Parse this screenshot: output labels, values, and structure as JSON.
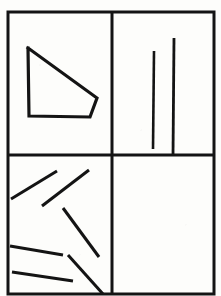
{
  "figure": {
    "background_color": "#fdfdfb",
    "ink_color": "#141414",
    "canvas": {
      "width": 221,
      "height": 296
    }
  },
  "frame": {
    "name": "outer-border",
    "x": 8,
    "y": 12,
    "width": 206,
    "height": 282,
    "stroke_width": 3
  },
  "dividers": [
    {
      "name": "vertical-divider",
      "orientation": "vertical",
      "x1": 112,
      "y1": 12,
      "x2": 112,
      "y2": 294,
      "stroke_width": 3
    },
    {
      "name": "horizontal-divider",
      "orientation": "horizontal",
      "x1": 8,
      "y1": 155,
      "x2": 214,
      "y2": 155,
      "stroke_width": 3
    }
  ],
  "panels": [
    {
      "id": "top-left",
      "label": "upper-left-panel",
      "content_type": "polygon",
      "item_count": 1
    },
    {
      "id": "top-right",
      "label": "upper-right-panel",
      "content_type": "vertical-lines",
      "item_count": 2
    },
    {
      "id": "bottom-left",
      "label": "lower-left-panel",
      "content_type": "oblique-lines",
      "item_count": 6
    },
    {
      "id": "bottom-right",
      "label": "lower-right-panel",
      "content_type": "empty",
      "item_count": 0
    }
  ],
  "polygon": {
    "name": "pentagon-shape",
    "points": "28,48 97,98 90,117 29,116 28,48",
    "stroke_width": 3.2,
    "fill": "none"
  },
  "vertical_lines": [
    {
      "name": "vertical-line-left",
      "x1": 154,
      "y1": 51,
      "x2": 153,
      "y2": 149,
      "stroke_width": 2.6
    },
    {
      "name": "vertical-line-right",
      "x1": 174,
      "y1": 38,
      "x2": 173,
      "y2": 156,
      "stroke_width": 2.8
    }
  ],
  "oblique_lines": [
    {
      "name": "oblique-line-1",
      "x1": 11,
      "y1": 199,
      "x2": 57,
      "y2": 171,
      "stroke_width": 3.0
    },
    {
      "name": "oblique-line-2",
      "x1": 42,
      "y1": 206,
      "x2": 89,
      "y2": 170,
      "stroke_width": 3.0
    },
    {
      "name": "oblique-line-3",
      "x1": 63,
      "y1": 208,
      "x2": 99,
      "y2": 257,
      "stroke_width": 3.0
    },
    {
      "name": "oblique-line-4",
      "x1": 10,
      "y1": 246,
      "x2": 63,
      "y2": 255,
      "stroke_width": 3.0
    },
    {
      "name": "oblique-line-5",
      "x1": 68,
      "y1": 255,
      "x2": 103,
      "y2": 294,
      "stroke_width": 3.0
    },
    {
      "name": "oblique-line-6",
      "x1": 12,
      "y1": 272,
      "x2": 73,
      "y2": 281,
      "stroke_width": 3.0
    }
  ]
}
